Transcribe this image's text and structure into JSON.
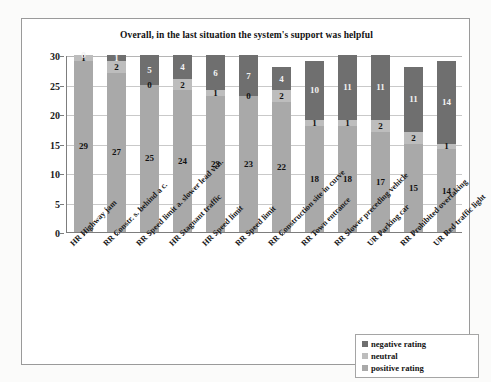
{
  "chart_data": {
    "type": "bar",
    "subtype": "stacked-vertical",
    "title": "Overall, in the last situation the system's support was helpful",
    "xlabel": "",
    "ylabel": "",
    "ylim": [
      0,
      30
    ],
    "yticks": [
      0,
      5,
      10,
      15,
      20,
      25,
      30
    ],
    "grid": true,
    "legend_position": "bottom-right",
    "categories": [
      "HR Highway jam",
      "RR Constr. s. behind a c.",
      "RR Speed limit a. slower lead veh.",
      "HR Stagnant traffic",
      "HR Speed limit",
      "RR Speed limit",
      "RR Construction site in curve",
      "RR Town entrance",
      "RR Slower preceding vehicle",
      "UR Parking car",
      "RR Prohibited overtaking",
      "UR Red traffic light"
    ],
    "series": [
      {
        "name": "positive rating",
        "color": "#a9a9a9",
        "values": [
          29,
          27,
          25,
          24,
          23,
          23,
          22,
          18,
          18,
          17,
          15,
          14
        ]
      },
      {
        "name": "neutral",
        "color": "#bdbdbd",
        "values": [
          1,
          2,
          0,
          2,
          1,
          0,
          2,
          1,
          1,
          2,
          2,
          1
        ]
      },
      {
        "name": "negative rating",
        "color": "#6f6f6f",
        "values": [
          0,
          1,
          5,
          4,
          6,
          7,
          4,
          10,
          11,
          11,
          11,
          14
        ]
      }
    ],
    "legend": [
      {
        "label": "negative rating",
        "color": "#6f6f6f"
      },
      {
        "label": "neutral",
        "color": "#bdbdbd"
      },
      {
        "label": "positive rating",
        "color": "#a9a9a9"
      }
    ]
  }
}
